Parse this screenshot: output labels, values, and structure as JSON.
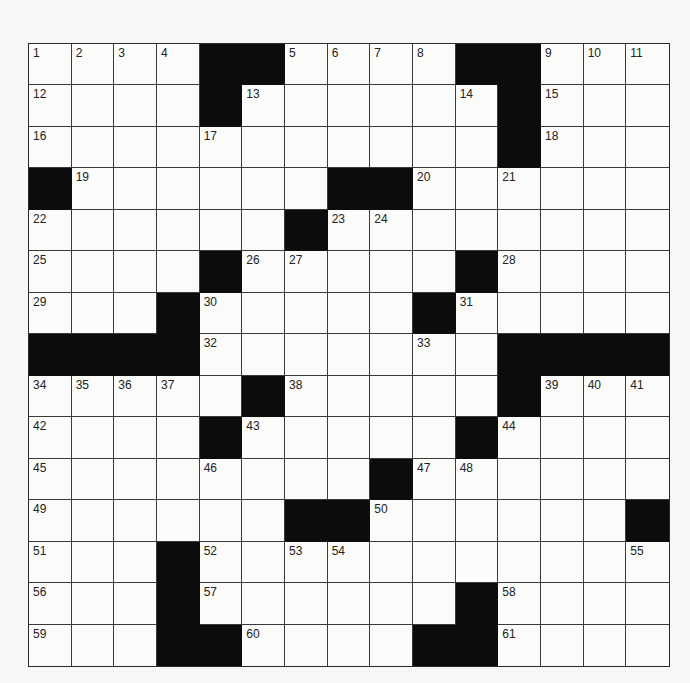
{
  "puzzle": {
    "rows": 15,
    "cols": 15,
    "colors": {
      "block": "#0c0c0c",
      "cell": "#fbfbf9",
      "line": "#3a3a3a",
      "background": "#f7f7f5"
    },
    "grid": [
      "....##....##...",
      "....#......#...",
      "...........#...",
      "#......##......",
      "......#........",
      "....#.....#....",
      "...#.....#.....",
      "####.......####",
      ".....#.....#...",
      "....#.....#....",
      "........#......",
      "......##......#",
      "...#...........",
      "...#......#....",
      "...##....##...."
    ],
    "numbers": [
      {
        "r": 0,
        "c": 0,
        "n": "1"
      },
      {
        "r": 0,
        "c": 1,
        "n": "2"
      },
      {
        "r": 0,
        "c": 2,
        "n": "3"
      },
      {
        "r": 0,
        "c": 3,
        "n": "4"
      },
      {
        "r": 0,
        "c": 6,
        "n": "5"
      },
      {
        "r": 0,
        "c": 7,
        "n": "6"
      },
      {
        "r": 0,
        "c": 8,
        "n": "7"
      },
      {
        "r": 0,
        "c": 9,
        "n": "8"
      },
      {
        "r": 0,
        "c": 12,
        "n": "9"
      },
      {
        "r": 0,
        "c": 13,
        "n": "10"
      },
      {
        "r": 0,
        "c": 14,
        "n": "11"
      },
      {
        "r": 1,
        "c": 0,
        "n": "12"
      },
      {
        "r": 1,
        "c": 5,
        "n": "13"
      },
      {
        "r": 1,
        "c": 10,
        "n": "14"
      },
      {
        "r": 1,
        "c": 12,
        "n": "15"
      },
      {
        "r": 2,
        "c": 0,
        "n": "16"
      },
      {
        "r": 2,
        "c": 4,
        "n": "17"
      },
      {
        "r": 2,
        "c": 12,
        "n": "18"
      },
      {
        "r": 3,
        "c": 1,
        "n": "19"
      },
      {
        "r": 3,
        "c": 9,
        "n": "20"
      },
      {
        "r": 3,
        "c": 11,
        "n": "21"
      },
      {
        "r": 4,
        "c": 0,
        "n": "22"
      },
      {
        "r": 4,
        "c": 7,
        "n": "23"
      },
      {
        "r": 4,
        "c": 8,
        "n": "24"
      },
      {
        "r": 5,
        "c": 0,
        "n": "25"
      },
      {
        "r": 5,
        "c": 5,
        "n": "26"
      },
      {
        "r": 5,
        "c": 6,
        "n": "27"
      },
      {
        "r": 5,
        "c": 11,
        "n": "28"
      },
      {
        "r": 6,
        "c": 0,
        "n": "29"
      },
      {
        "r": 6,
        "c": 4,
        "n": "30"
      },
      {
        "r": 6,
        "c": 10,
        "n": "31"
      },
      {
        "r": 7,
        "c": 4,
        "n": "32"
      },
      {
        "r": 7,
        "c": 9,
        "n": "33"
      },
      {
        "r": 8,
        "c": 0,
        "n": "34"
      },
      {
        "r": 8,
        "c": 1,
        "n": "35"
      },
      {
        "r": 8,
        "c": 2,
        "n": "36"
      },
      {
        "r": 8,
        "c": 3,
        "n": "37"
      },
      {
        "r": 8,
        "c": 6,
        "n": "38"
      },
      {
        "r": 8,
        "c": 12,
        "n": "39"
      },
      {
        "r": 8,
        "c": 13,
        "n": "40"
      },
      {
        "r": 8,
        "c": 14,
        "n": "41"
      },
      {
        "r": 9,
        "c": 0,
        "n": "42"
      },
      {
        "r": 9,
        "c": 5,
        "n": "43"
      },
      {
        "r": 9,
        "c": 11,
        "n": "44"
      },
      {
        "r": 10,
        "c": 0,
        "n": "45"
      },
      {
        "r": 10,
        "c": 4,
        "n": "46"
      },
      {
        "r": 10,
        "c": 9,
        "n": "47"
      },
      {
        "r": 10,
        "c": 10,
        "n": "48"
      },
      {
        "r": 11,
        "c": 0,
        "n": "49"
      },
      {
        "r": 11,
        "c": 8,
        "n": "50"
      },
      {
        "r": 12,
        "c": 0,
        "n": "51"
      },
      {
        "r": 12,
        "c": 4,
        "n": "52"
      },
      {
        "r": 12,
        "c": 6,
        "n": "53"
      },
      {
        "r": 12,
        "c": 7,
        "n": "54"
      },
      {
        "r": 12,
        "c": 14,
        "n": "55"
      },
      {
        "r": 13,
        "c": 0,
        "n": "56"
      },
      {
        "r": 13,
        "c": 4,
        "n": "57"
      },
      {
        "r": 13,
        "c": 11,
        "n": "58"
      },
      {
        "r": 14,
        "c": 0,
        "n": "59"
      },
      {
        "r": 14,
        "c": 5,
        "n": "60"
      },
      {
        "r": 14,
        "c": 11,
        "n": "61"
      }
    ]
  }
}
